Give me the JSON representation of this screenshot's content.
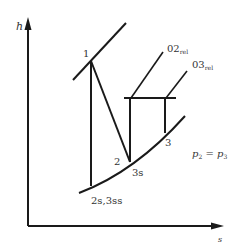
{
  "diagram": {
    "type": "h-s diagram",
    "axes": {
      "y_label": "h",
      "x_label": "s"
    },
    "points": {
      "p1": "1",
      "p2": "2",
      "p3": "3",
      "p3s": "3s",
      "p2s3ss": "2s,3ss"
    },
    "stagnation": {
      "o2_main": "02",
      "o2_sub": "rel",
      "o3_main": "03",
      "o3_sub": "rel"
    },
    "pressure_note": {
      "p2": "p",
      "p2_sub": "2",
      "eq": " = ",
      "p3": "p",
      "p3_sub": "3"
    },
    "colors": {
      "line": "#1a1a1a",
      "text": "#333333",
      "background": "#ffffff"
    }
  }
}
